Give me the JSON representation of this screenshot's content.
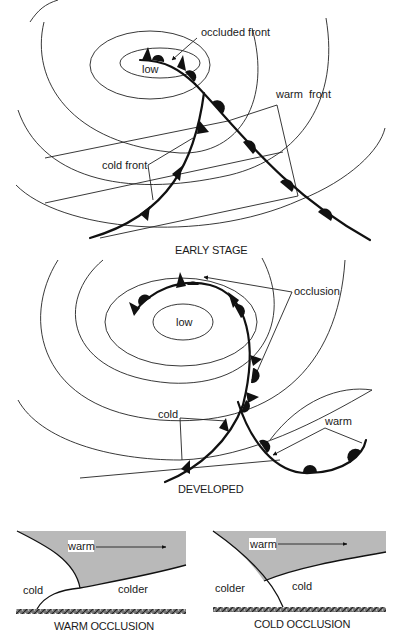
{
  "figure": {
    "type": "meteorological diagram",
    "colors": {
      "ink": "#111111",
      "warm_air_fill": "#b9b9b9",
      "background": "#ffffff"
    }
  },
  "early_stage": {
    "caption": "EARLY STAGE",
    "labels": {
      "low": "low",
      "occluded_front": "occluded front",
      "warm_front": "warm  front",
      "cold_front": "cold front"
    }
  },
  "developed": {
    "caption": "DEVELOPED",
    "labels": {
      "low": "low",
      "occlusion": "occlusion",
      "cold": "cold",
      "warm": "warm"
    }
  },
  "warm_occlusion": {
    "caption": "WARM OCCLUSION",
    "labels": {
      "warm": "warm",
      "cold": "cold",
      "colder": "colder"
    }
  },
  "cold_occlusion": {
    "caption": "COLD OCCLUSION",
    "labels": {
      "warm": "warm",
      "colder": "colder",
      "cold": "cold"
    }
  }
}
